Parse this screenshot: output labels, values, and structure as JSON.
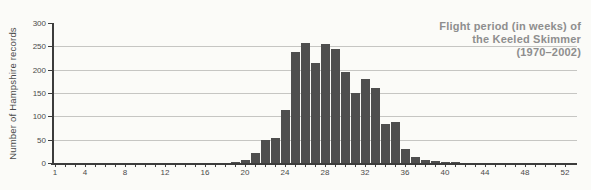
{
  "title": {
    "lines": [
      "Flight period (in weeks) of",
      "the Keeled Skimmer",
      "(1970–2002)"
    ]
  },
  "y_axis": {
    "label": "Number of Hampshire records",
    "tick_values": [
      0,
      50,
      100,
      150,
      200,
      250,
      300
    ]
  },
  "x_axis": {
    "labeled_ticks": [
      1,
      4,
      8,
      12,
      16,
      20,
      24,
      28,
      32,
      36,
      40,
      44,
      48,
      52
    ],
    "minor_ticks_range": [
      1,
      52
    ]
  },
  "chart_data": {
    "type": "bar",
    "title": "Flight period (in weeks) of the Keeled Skimmer (1970–2002)",
    "xlabel": "",
    "ylabel": "Number of Hampshire records",
    "x": [
      19,
      20,
      21,
      22,
      23,
      24,
      25,
      26,
      27,
      28,
      29,
      30,
      31,
      32,
      33,
      34,
      35,
      36,
      37,
      38,
      39,
      40,
      41
    ],
    "values": [
      3,
      6,
      21,
      50,
      53,
      113,
      238,
      258,
      215,
      255,
      245,
      195,
      150,
      180,
      160,
      83,
      88,
      30,
      13,
      7,
      4,
      3,
      1
    ],
    "xlim": [
      0,
      53
    ],
    "ylim": [
      0,
      300
    ],
    "ytick_step": 50,
    "xticks_labeled": [
      1,
      4,
      8,
      12,
      16,
      20,
      24,
      28,
      32,
      36,
      40,
      44,
      48,
      52
    ],
    "grid": "horizontal gridlines at 50, 100, 150, 200, 250",
    "legend": "none",
    "colors": {
      "bar": "#4e4e4e",
      "grid": "#c6c6c3",
      "axis": "#3c3c3c",
      "title": "#8e8e8e",
      "text": "#4a4a4a",
      "background": "#fbfbf8"
    }
  }
}
